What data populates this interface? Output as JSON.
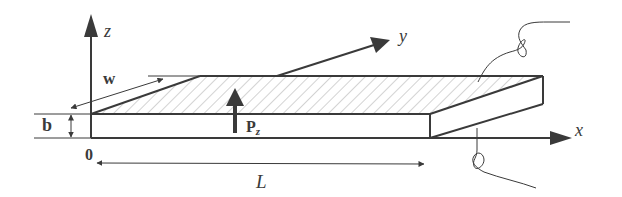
{
  "figure": {
    "colors": {
      "stroke": "#3a3a3a",
      "hatch": "#9a9a9a",
      "background": "#ffffff"
    }
  },
  "axes": {
    "x_label": "x",
    "y_label": "y",
    "z_label": "z",
    "origin_label": "0"
  },
  "dimensions": {
    "width_label": "w",
    "thickness_label": "b",
    "length_label": "L"
  },
  "load": {
    "label_main": "P",
    "label_sub": "z"
  }
}
